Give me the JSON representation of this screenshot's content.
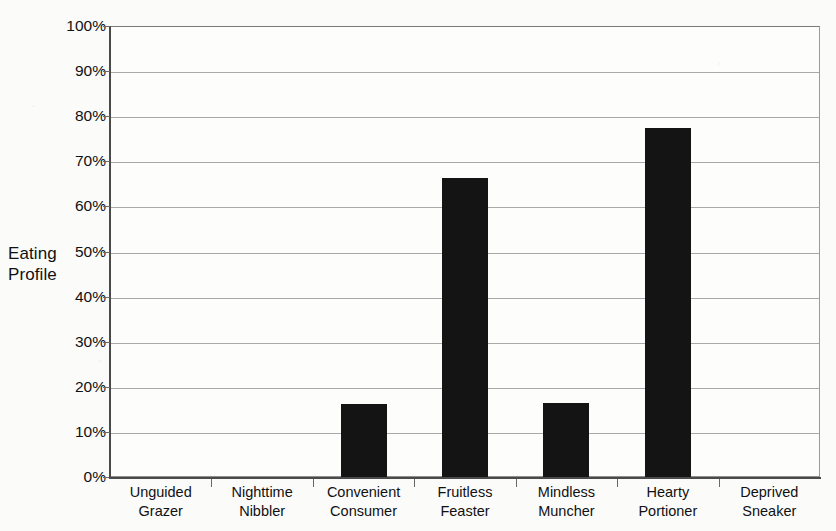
{
  "chart_data": {
    "type": "bar",
    "title": "",
    "xlabel": "",
    "ylabel": "Eating Profile",
    "ylabel_lines": [
      "Eating",
      "Profile"
    ],
    "categories": [
      "Unguided Grazer",
      "Nighttime Nibbler",
      "Convenient Consumer",
      "Fruitless Feaster",
      "Mindless Muncher",
      "Hearty Portioner",
      "Deprived Sneaker"
    ],
    "category_label_lines": [
      [
        "Unguided",
        "Grazer"
      ],
      [
        "Nighttime",
        "Nibbler"
      ],
      [
        "Convenient",
        "Consumer"
      ],
      [
        "Fruitless",
        "Feaster"
      ],
      [
        "Mindless",
        "Muncher"
      ],
      [
        "Hearty",
        "Portioner"
      ],
      [
        "Deprived",
        "Sneaker"
      ]
    ],
    "values": [
      0,
      0,
      16.1,
      66.2,
      16.5,
      77.4,
      0
    ],
    "ylim": [
      0,
      100
    ],
    "y_tick_values": [
      0,
      10,
      20,
      30,
      40,
      50,
      60,
      70,
      80,
      90,
      100
    ],
    "y_tick_labels": [
      "0%",
      "10%",
      "20%",
      "30%",
      "40%",
      "50%",
      "60%",
      "70%",
      "80%",
      "90%",
      "100%"
    ],
    "grid": true,
    "grid_axis": "y",
    "legend": false,
    "legend_position": "none",
    "bar_color": "#141414",
    "grid_color": "#a8a8a8",
    "axis_color": "#4a4a4a",
    "plot_background": "#fdfdfc",
    "page_background": "#fbfbfa"
  }
}
